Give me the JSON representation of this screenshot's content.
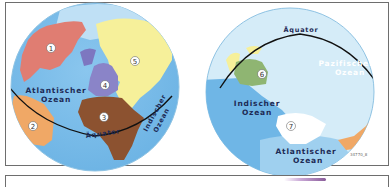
{
  "figure": {
    "type": "world-hemisphere-maps",
    "credit": "34770_8",
    "colors": {
      "ocean_deep": "#6fb6e6",
      "ocean_light": "#cde8f6",
      "outline": "#8fc3e3",
      "equator": "#111111",
      "north_america": "#e07d72",
      "south_america": "#f0a866",
      "africa": "#8c5230",
      "europe": "#8a84c8",
      "asia": "#f6f09a",
      "australia": "#8fb572",
      "antarctica": "#ffffff",
      "label_text": "#1d2a55"
    }
  },
  "left_globe": {
    "continents": [
      {
        "number": "1",
        "name": "north-america"
      },
      {
        "number": "2",
        "name": "south-america"
      },
      {
        "number": "3",
        "name": "africa"
      },
      {
        "number": "4",
        "name": "europe"
      },
      {
        "number": "5",
        "name": "asia"
      }
    ],
    "labels": {
      "atlantic_line1": "Atlantischer",
      "atlantic_line2": "Ozean",
      "equator": "Äquator",
      "indian_line1": "Indischer",
      "indian_line2": "Ozean"
    }
  },
  "right_globe": {
    "continents": [
      {
        "number": "6",
        "name": "australia"
      },
      {
        "number": "7",
        "name": "antarctica"
      }
    ],
    "labels": {
      "equator": "Äquator",
      "pacific_line1": "Pazifischer",
      "pacific_line2": "Ozean",
      "indian_line1": "Indischer",
      "indian_line2": "Ozean",
      "atlantic_line1": "Atlantischer",
      "atlantic_line2": "Ozean"
    }
  }
}
